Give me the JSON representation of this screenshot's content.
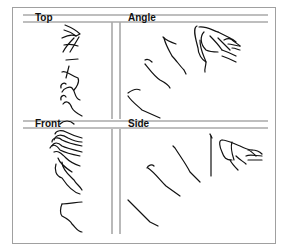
{
  "figure": {
    "panels": [
      {
        "id": "top",
        "label": "Top"
      },
      {
        "id": "angle",
        "label": "Angle"
      },
      {
        "id": "front",
        "label": "Front"
      },
      {
        "id": "side",
        "label": "Side"
      }
    ],
    "colors": {
      "frame": "#9a9a9a",
      "divider": "#a8a8a8",
      "stroke": "#111111"
    }
  }
}
